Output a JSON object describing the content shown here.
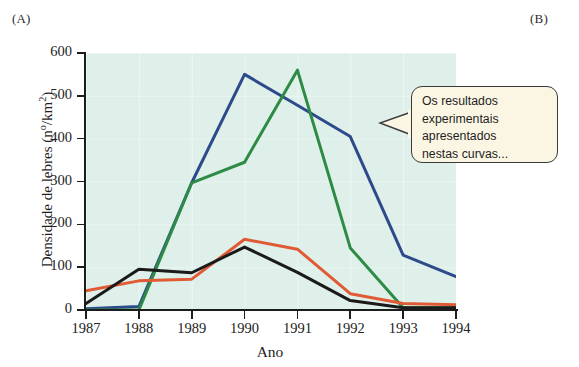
{
  "figure": {
    "panel_a_label": "(A)",
    "panel_b_label": "(B)"
  },
  "callout": {
    "name": "speech-balloon",
    "text": "Os resultados\nexperimentais\napresentados\nnestas curvas...",
    "background_color": "#fbf6e4",
    "border_color": "#3a3a3a"
  },
  "chart_data": {
    "type": "line",
    "title": "",
    "xlabel": "Ano",
    "ylabel": "Densidade de lebres (nº/km²)",
    "categories": [
      "1987",
      "1988",
      "1989",
      "1990",
      "1991",
      "1992",
      "1993",
      "1994"
    ],
    "x": [
      1987,
      1988,
      1989,
      1990,
      1991,
      1992,
      1993,
      1994
    ],
    "xlim": [
      1987,
      1994
    ],
    "ylim": [
      0,
      600
    ],
    "yticks": [
      0,
      100,
      200,
      300,
      400,
      500,
      600
    ],
    "grid": true,
    "legend": "none",
    "plot_background": "#dff0ea",
    "series": [
      {
        "name": "blue-curve",
        "color": "#2d4a8a",
        "values": [
          3,
          8,
          297,
          550,
          478,
          405,
          128,
          78
        ]
      },
      {
        "name": "green-curve",
        "color": "#2e8b45",
        "values": [
          0,
          0,
          297,
          345,
          560,
          145,
          5,
          5
        ]
      },
      {
        "name": "orange-curve",
        "color": "#e05a35",
        "values": [
          45,
          68,
          72,
          165,
          142,
          38,
          15,
          12
        ]
      },
      {
        "name": "black-curve",
        "color": "#1a1a1a",
        "values": [
          15,
          95,
          87,
          147,
          88,
          22,
          5,
          5
        ]
      }
    ]
  },
  "ytick_labels": [
    "600",
    "500",
    "400",
    "300",
    "200",
    "100",
    "0"
  ],
  "xtick_labels": [
    "1987",
    "1988",
    "1989",
    "1990",
    "1991",
    "1992",
    "1993",
    "1994"
  ]
}
